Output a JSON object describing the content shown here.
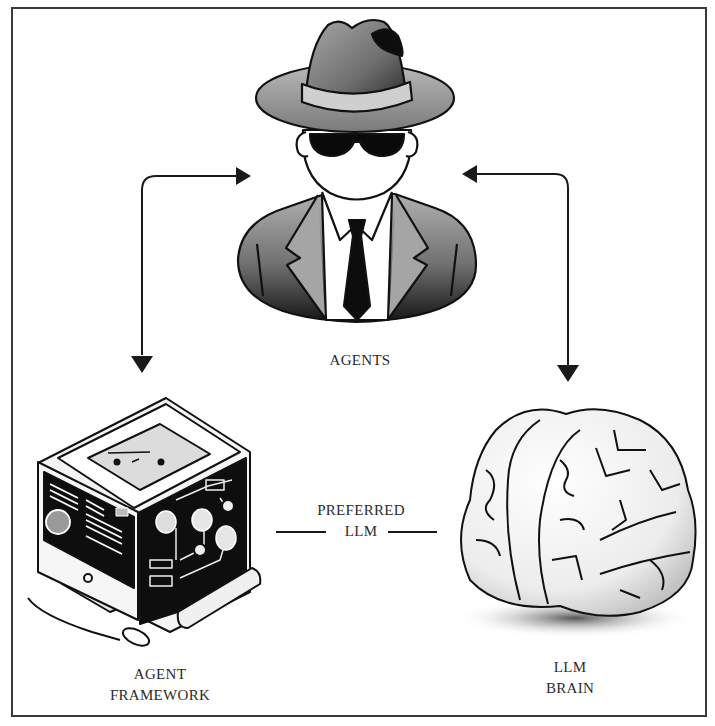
{
  "diagram": {
    "nodes": [
      {
        "id": "agents",
        "label_lines": [
          "AGENTS"
        ],
        "icon": "spy-agent-icon"
      },
      {
        "id": "framework",
        "label_lines": [
          "AGENT",
          "FRAMEWORK"
        ],
        "icon": "computer-framework-icon"
      },
      {
        "id": "brain",
        "label_lines": [
          "LLM",
          "BRAIN"
        ],
        "icon": "brain-icon"
      }
    ],
    "edges": [
      {
        "from": "agents",
        "to": "framework",
        "style": "bidirectional-arrow"
      },
      {
        "from": "agents",
        "to": "brain",
        "style": "bidirectional-arrow"
      },
      {
        "from": "framework",
        "to": "brain",
        "style": "line",
        "label_lines": [
          "PREFERRED",
          "LLM"
        ]
      }
    ]
  },
  "colors": {
    "ink": "#1a1a1a",
    "frame": "#3a3a3a",
    "text": "#2b2b2b",
    "fill_light": "#f2f2f2",
    "fill_mid": "#9a9a9a",
    "fill_dark": "#111111"
  }
}
